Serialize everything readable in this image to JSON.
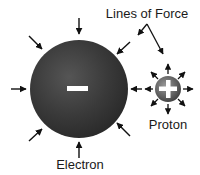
{
  "labels": {
    "lines_of_force": "Lines of Force",
    "proton": "Proton",
    "electron": "Electron"
  },
  "electron": {
    "charge_symbol": "minus",
    "color": "#3a3a3a"
  },
  "proton": {
    "charge_symbol": "plus",
    "color": "#6a6a6a"
  },
  "colors": {
    "arrow": "#111111",
    "background": "#ffffff",
    "text": "#1a1a1a"
  }
}
